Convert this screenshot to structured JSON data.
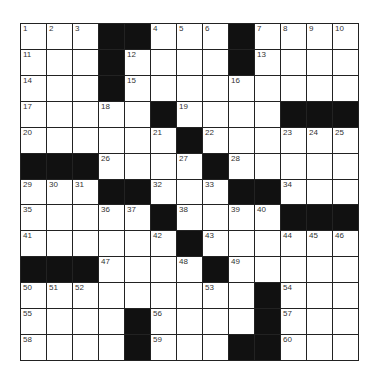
{
  "puzzle": {
    "rows": 13,
    "cols": 13,
    "grid": [
      [
        "1",
        "2",
        "3",
        "#",
        "#",
        "4",
        "5",
        "6",
        "#",
        "7",
        "8",
        "9",
        "10"
      ],
      [
        "11",
        "",
        "",
        "#",
        "12",
        "",
        "",
        "",
        "#",
        "13",
        "",
        "",
        ""
      ],
      [
        "14",
        "",
        "",
        "#",
        "15",
        "",
        "",
        "",
        "16",
        "",
        "",
        "",
        ""
      ],
      [
        "17",
        "",
        "",
        "18",
        "",
        "#",
        "19",
        "",
        "",
        "",
        "#",
        "#",
        "#"
      ],
      [
        "20",
        "",
        "",
        "",
        "",
        "21",
        "#",
        "22",
        "",
        "",
        "23",
        "24",
        "25"
      ],
      [
        "#",
        "#",
        "#",
        "26",
        "",
        "",
        "27",
        "#",
        "28",
        "",
        "",
        "",
        ""
      ],
      [
        "29",
        "30",
        "31",
        "#",
        "#",
        "32",
        "",
        "33",
        "#",
        "#",
        "34",
        "",
        ""
      ],
      [
        "35",
        "",
        "",
        "36",
        "37",
        "#",
        "38",
        "",
        "39",
        "40",
        "#",
        "#",
        "#"
      ],
      [
        "41",
        "",
        "",
        "",
        "",
        "42",
        "#",
        "43",
        "",
        "",
        "44",
        "45",
        "46"
      ],
      [
        "#",
        "#",
        "#",
        "47",
        "",
        "",
        "48",
        "#",
        "49",
        "",
        "",
        "",
        ""
      ],
      [
        "50",
        "51",
        "52",
        "",
        "",
        "",
        "",
        "53",
        "",
        "#",
        "54",
        "",
        ""
      ],
      [
        "55",
        "",
        "",
        "",
        "#",
        "56",
        "",
        "",
        "",
        "#",
        "57",
        "",
        ""
      ],
      [
        "58",
        "",
        "",
        "",
        "#",
        "59",
        "",
        "",
        "#",
        "#",
        "60",
        "",
        ""
      ]
    ]
  }
}
